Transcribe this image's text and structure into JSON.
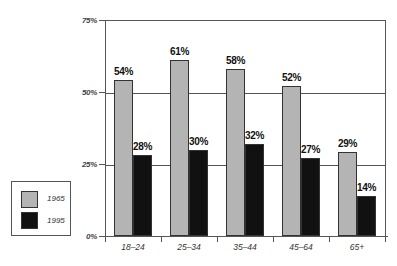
{
  "chart_data": {
    "type": "bar",
    "title": "",
    "xlabel": "",
    "ylabel": "",
    "categories": [
      "18–24",
      "25–34",
      "35–44",
      "45–64",
      "65+"
    ],
    "series": [
      {
        "name": "1965",
        "values": [
          54,
          61,
          58,
          52,
          29
        ],
        "color": "#b4b4b4"
      },
      {
        "name": "1995",
        "values": [
          28,
          30,
          32,
          27,
          14
        ],
        "color": "#111111"
      }
    ],
    "value_labels": {
      "1965": [
        "54%",
        "61%",
        "58%",
        "52%",
        "29%"
      ],
      "1995": [
        "28%",
        "30%",
        "32%",
        "27%",
        "14%"
      ]
    },
    "ylim": [
      0,
      75
    ],
    "yticks": [
      "0%",
      "25%",
      "50%",
      "75%"
    ],
    "grid": true,
    "legend_position": "left"
  },
  "legend": {
    "items": [
      {
        "label": "1965",
        "color": "#b4b4b4"
      },
      {
        "label": "1995",
        "color": "#111111"
      }
    ]
  }
}
